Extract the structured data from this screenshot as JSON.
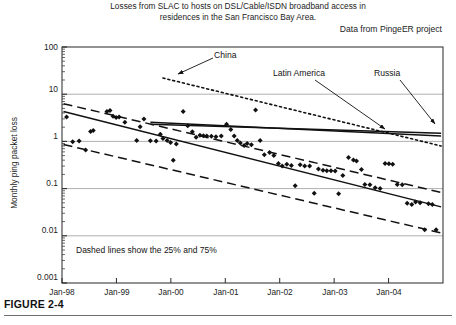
{
  "figure": {
    "caption": "FIGURE 2-4",
    "title_line1": "Losses from SLAC to hosts on DSL/Cable/ISDN broadband access in",
    "title_line2": "residences in the San Francisco Bay Area.",
    "source_note": "Data from PingeER project"
  },
  "chart_data": {
    "type": "scatter",
    "title": "Losses from SLAC to hosts on DSL/Cable/ISDN broadband access in residences in the San Francisco Bay Area.",
    "subtitle": "Data from PingeER project",
    "xlabel": "",
    "ylabel": "Monthly ping packet loss",
    "yscale": "log",
    "ylim": [
      0.001,
      100
    ],
    "ytick_labels": [
      "100",
      "10",
      "1",
      "0.1",
      "0.01",
      "0.001"
    ],
    "ytick_values": [
      100,
      10,
      1,
      0.1,
      0.01,
      0.001
    ],
    "xtick_labels": [
      "Jan-98",
      "Jan-99",
      "Jan-00",
      "Jan-01",
      "Jan-02",
      "Jan-03",
      "Jan-04"
    ],
    "xlim": [
      "Jan-98",
      "Jan-05"
    ],
    "grid": "horizontal",
    "legend": "none",
    "annotations": [
      {
        "label": "China",
        "x": 0.42,
        "y": 17.0
      },
      {
        "label": "Latin America",
        "x": 0.66,
        "y": 22.0
      },
      {
        "label": "Russia",
        "x": 0.87,
        "y": 22.0
      },
      {
        "label": "Dashed lines show the 25% and 75%",
        "x": 0.06,
        "y": 0.0045
      }
    ],
    "series": [
      {
        "name": "San Francisco Bay Area residences (median monthly ping packet loss)",
        "marker": "diamond",
        "color": "#111111",
        "points": [
          [
            0.012,
            3.3
          ],
          [
            0.028,
            0.98
          ],
          [
            0.045,
            1.02
          ],
          [
            0.062,
            0.66
          ],
          [
            0.075,
            1.62
          ],
          [
            0.082,
            1.7
          ],
          [
            0.118,
            4.3
          ],
          [
            0.126,
            4.5
          ],
          [
            0.134,
            3.4
          ],
          [
            0.142,
            3.2
          ],
          [
            0.15,
            3.3
          ],
          [
            0.165,
            2.55
          ],
          [
            0.196,
            1.05
          ],
          [
            0.205,
            2.05
          ],
          [
            0.215,
            3.0
          ],
          [
            0.232,
            1.03
          ],
          [
            0.247,
            1.02
          ],
          [
            0.258,
            1.42
          ],
          [
            0.265,
            1.15
          ],
          [
            0.276,
            1.05
          ],
          [
            0.285,
            0.95
          ],
          [
            0.292,
            0.4
          ],
          [
            0.3,
            0.88
          ],
          [
            0.318,
            4.3
          ],
          [
            0.33,
            2.15
          ],
          [
            0.342,
            1.6
          ],
          [
            0.352,
            1.22
          ],
          [
            0.362,
            1.35
          ],
          [
            0.371,
            1.32
          ],
          [
            0.38,
            1.3
          ],
          [
            0.392,
            1.28
          ],
          [
            0.404,
            1.26
          ],
          [
            0.418,
            1.3
          ],
          [
            0.432,
            2.3
          ],
          [
            0.443,
            1.78
          ],
          [
            0.452,
            1.3
          ],
          [
            0.46,
            1.05
          ],
          [
            0.468,
            0.93
          ],
          [
            0.478,
            0.82
          ],
          [
            0.486,
            0.9
          ],
          [
            0.497,
            0.85
          ],
          [
            0.508,
            4.6
          ],
          [
            0.52,
            1.05
          ],
          [
            0.531,
            0.52
          ],
          [
            0.545,
            0.58
          ],
          [
            0.556,
            0.5
          ],
          [
            0.568,
            0.34
          ],
          [
            0.578,
            0.3
          ],
          [
            0.59,
            0.33
          ],
          [
            0.602,
            0.31
          ],
          [
            0.612,
            0.115
          ],
          [
            0.625,
            0.32
          ],
          [
            0.637,
            0.3
          ],
          [
            0.65,
            0.3
          ],
          [
            0.662,
            0.08
          ],
          [
            0.673,
            0.26
          ],
          [
            0.685,
            0.245
          ],
          [
            0.695,
            0.238
          ],
          [
            0.706,
            0.24
          ],
          [
            0.717,
            0.235
          ],
          [
            0.726,
            0.078
          ],
          [
            0.737,
            0.19
          ],
          [
            0.752,
            0.455
          ],
          [
            0.765,
            0.405
          ],
          [
            0.773,
            0.385
          ],
          [
            0.786,
            0.255
          ],
          [
            0.795,
            0.122
          ],
          [
            0.808,
            0.12
          ],
          [
            0.822,
            0.104
          ],
          [
            0.835,
            0.1
          ],
          [
            0.848,
            0.34
          ],
          [
            0.858,
            0.335
          ],
          [
            0.868,
            0.33
          ],
          [
            0.88,
            0.122
          ],
          [
            0.893,
            0.12
          ],
          [
            0.906,
            0.049
          ],
          [
            0.918,
            0.046
          ],
          [
            0.928,
            0.052
          ],
          [
            0.94,
            0.05
          ],
          [
            0.952,
            0.0135
          ],
          [
            0.962,
            0.048
          ],
          [
            0.972,
            0.046
          ],
          [
            0.982,
            0.0135
          ]
        ]
      }
    ],
    "trend_lines": [
      {
        "name": "median-fit",
        "style": "solid",
        "x0": 0.004,
        "y0": 4.3,
        "x1": 0.995,
        "y1": 0.041
      },
      {
        "name": "75th-percentile",
        "style": "dashed",
        "x0": 0.004,
        "y0": 6.3,
        "x1": 0.995,
        "y1": 0.083
      },
      {
        "name": "25th-percentile",
        "style": "dashed",
        "x0": 0.004,
        "y0": 0.86,
        "x1": 0.995,
        "y1": 0.0115
      },
      {
        "name": "China",
        "style": "dotted",
        "x0": 0.265,
        "y0": 22.0,
        "x1": 0.995,
        "y1": 0.8
      },
      {
        "name": "Latin America",
        "style": "solid",
        "x0": 0.232,
        "y0": 2.55,
        "x1": 0.995,
        "y1": 1.3
      },
      {
        "name": "Russia",
        "style": "solid",
        "x0": 0.232,
        "y0": 2.3,
        "x1": 0.995,
        "y1": 1.48
      }
    ]
  }
}
